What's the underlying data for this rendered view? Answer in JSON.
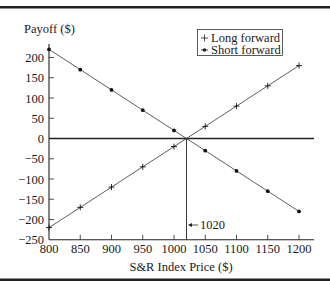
{
  "chart_data": {
    "type": "line",
    "title": "",
    "xlabel": "S&R Index Price ($)",
    "ylabel": "Payoff ($)",
    "x": [
      800,
      850,
      900,
      950,
      1000,
      1050,
      1100,
      1150,
      1200
    ],
    "series": [
      {
        "name": "Long forward",
        "marker": "plus",
        "values": [
          -220,
          -170,
          -120,
          -70,
          -20,
          30,
          80,
          130,
          180
        ]
      },
      {
        "name": "Short forward",
        "marker": "dot",
        "values": [
          220,
          170,
          120,
          70,
          20,
          -30,
          -80,
          -130,
          -180
        ]
      }
    ],
    "xticks": [
      800,
      850,
      900,
      950,
      1000,
      1050,
      1100,
      1150,
      1200
    ],
    "yticks": [
      200,
      150,
      100,
      50,
      0,
      -50,
      -100,
      -150,
      -200,
      -250
    ],
    "xlim": [
      800,
      1200
    ],
    "ylim": [
      -250,
      200
    ],
    "grid": false,
    "legend_position": "upper-right",
    "annotations": [
      {
        "text": "1020",
        "x": 1020,
        "type": "vertical-line-with-arrow",
        "note": "break-even forward price"
      }
    ],
    "reference_lines": [
      {
        "type": "horizontal",
        "y": 0
      },
      {
        "type": "vertical",
        "x": 1020
      }
    ]
  },
  "labels": {
    "ylabel": "Payoff ($)",
    "xlabel": "S&R Index Price ($)",
    "legend_long": "Long forward",
    "legend_short": "Short forward",
    "annotation": "1020",
    "xtick": [
      "800",
      "850",
      "900",
      "950",
      "1000",
      "1050",
      "1100",
      "1150",
      "1200"
    ],
    "ytick": [
      "200",
      "150",
      "100",
      "50",
      "0",
      "−50",
      "−100",
      "−150",
      "−200",
      "−250"
    ]
  },
  "colors": {
    "ink": "#1a1a1a",
    "rule": "#222222",
    "background": "#ffffff"
  }
}
